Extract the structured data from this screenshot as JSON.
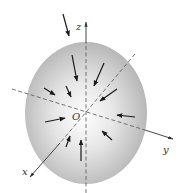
{
  "diagram": {
    "type": "3d-axes-ellipsoid-with-inward-arrows",
    "origin_label": "O",
    "axes": [
      {
        "name": "x",
        "label": "x"
      },
      {
        "name": "y",
        "label": "y"
      },
      {
        "name": "z",
        "label": "z"
      }
    ],
    "colors": {
      "ellipsoid_center": "#ffffff",
      "ellipsoid_edge": "#b5b5b5",
      "axis": "#555555",
      "arrow": "#1a1a1a"
    },
    "arrow_count": 12,
    "arrow_direction": "inward toward origin"
  }
}
